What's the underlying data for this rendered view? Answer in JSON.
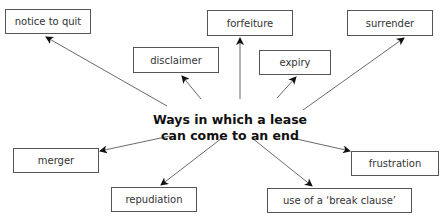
{
  "diagram": {
    "center_title": {
      "line1": "Ways in which a lease",
      "line2": "can come to an end"
    },
    "nodes": [
      {
        "id": "notice_to_quit",
        "label": "notice to quit"
      },
      {
        "id": "forfeiture",
        "label": "forfeiture"
      },
      {
        "id": "surrender",
        "label": "surrender"
      },
      {
        "id": "disclaimer",
        "label": "disclaimer"
      },
      {
        "id": "expiry",
        "label": "expiry"
      },
      {
        "id": "merger",
        "label": "merger"
      },
      {
        "id": "repudiation",
        "label": "repudiation"
      },
      {
        "id": "frustration",
        "label": "frustration"
      },
      {
        "id": "break_clause",
        "label": "use of a ‘break clause’"
      }
    ],
    "edges": [
      {
        "from": "center",
        "to": "notice_to_quit"
      },
      {
        "from": "center",
        "to": "forfeiture"
      },
      {
        "from": "center",
        "to": "surrender"
      },
      {
        "from": "center",
        "to": "disclaimer"
      },
      {
        "from": "center",
        "to": "expiry"
      },
      {
        "from": "center",
        "to": "merger"
      },
      {
        "from": "center",
        "to": "repudiation"
      },
      {
        "from": "center",
        "to": "frustration"
      },
      {
        "from": "center",
        "to": "break_clause"
      }
    ],
    "colors": {
      "line": "#444444",
      "box_border": "#555555",
      "text": "#333333",
      "title": "#111111"
    }
  }
}
